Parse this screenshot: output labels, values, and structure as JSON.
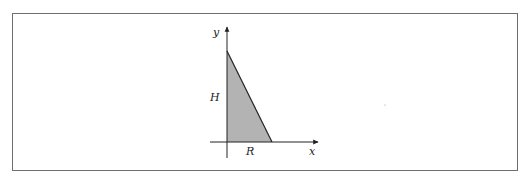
{
  "figure": {
    "type": "coordinate-diagram",
    "axes": {
      "x_label": "x",
      "y_label": "y"
    },
    "labels": {
      "height": "H",
      "base": "R"
    },
    "colors": {
      "fill": "#b3b3b3",
      "stroke": "#222222",
      "border": "#6e6e6e"
    }
  }
}
